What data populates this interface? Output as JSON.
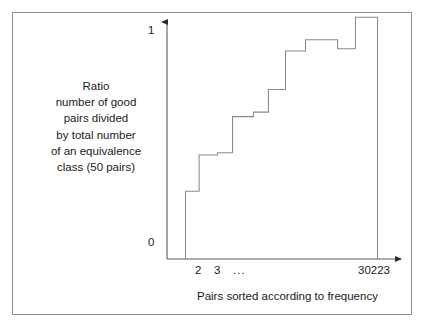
{
  "figure": {
    "background_color": "#ffffff",
    "frame_color": "#8d8d8d",
    "line_color": "#6e6e6e",
    "text_color": "#1a1a1a"
  },
  "caption": {
    "lines": [
      "Ratio",
      "number of good",
      "pairs divided",
      "by total number",
      "of an equivalence",
      "class (50 pairs)"
    ]
  },
  "axes": {
    "y_ticks": [
      "1",
      "0"
    ],
    "x_ticks": [
      "2",
      "3",
      "...",
      "30223"
    ],
    "x_title": "Pairs sorted according to frequency"
  },
  "chart_data": {
    "type": "line",
    "subtype": "step",
    "title": "",
    "xlabel": "Pairs sorted according to frequency",
    "ylabel": "Ratio number of good pairs divided by total number of an equivalence class (50 pairs)",
    "ylim": [
      0,
      1.08
    ],
    "yticks": [
      0,
      1
    ],
    "ytick_labels": [
      "0",
      "1"
    ],
    "xtick_labels": [
      "2",
      "3",
      "...",
      "30223"
    ],
    "grid": false,
    "legend": null,
    "x_axis_kind": "ordinal-rank",
    "steps": [
      {
        "index": 1,
        "x_start": 0.0,
        "x_end": 0.071,
        "value": 0.3
      },
      {
        "index": 2,
        "x_start": 0.071,
        "x_end": 0.167,
        "value": 0.46
      },
      {
        "index": 3,
        "x_start": 0.167,
        "x_end": 0.245,
        "value": 0.47
      },
      {
        "index": 4,
        "x_start": 0.245,
        "x_end": 0.354,
        "value": 0.63
      },
      {
        "index": 5,
        "x_start": 0.354,
        "x_end": 0.432,
        "value": 0.65
      },
      {
        "index": 6,
        "x_start": 0.432,
        "x_end": 0.521,
        "value": 0.75
      },
      {
        "index": 7,
        "x_start": 0.521,
        "x_end": 0.625,
        "value": 0.92
      },
      {
        "index": 8,
        "x_start": 0.625,
        "x_end": 0.792,
        "value": 0.97
      },
      {
        "index": 9,
        "x_start": 0.792,
        "x_end": 0.885,
        "value": 0.93
      },
      {
        "index": 10,
        "x_start": 0.885,
        "x_end": 1.0,
        "value": 1.07
      }
    ],
    "x_values": [
      0.0,
      0.071,
      0.167,
      0.245,
      0.354,
      0.432,
      0.521,
      0.625,
      0.792,
      0.885,
      1.0
    ],
    "y_values": [
      0.3,
      0.46,
      0.47,
      0.63,
      0.65,
      0.75,
      0.92,
      0.97,
      0.93,
      1.07
    ]
  }
}
